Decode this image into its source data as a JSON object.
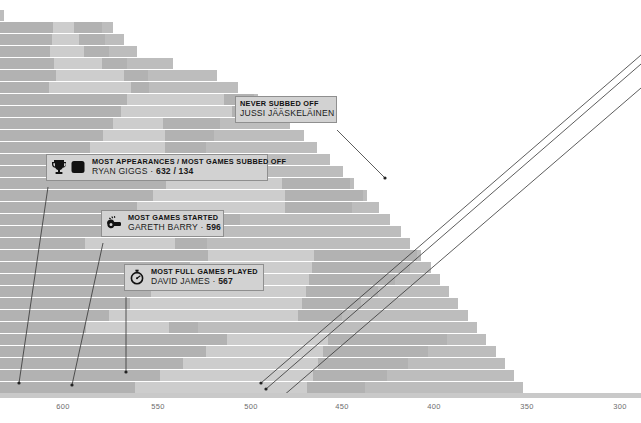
{
  "chart_data": {
    "type": "bar",
    "orientation": "horizontal",
    "title": "",
    "xlabel": "",
    "ylabel": "",
    "grid": false,
    "legend": "none",
    "xlim": [
      632,
      286
    ],
    "x_ticks": [
      600,
      550,
      500,
      450,
      400,
      350,
      300
    ],
    "x_tick_labels": [
      "600",
      "550",
      "500",
      "450",
      "400",
      "350",
      "300"
    ],
    "axis_direction": "descending",
    "note": "Stacked horizontal bars, one row per player, sorted descending by total appearances. Each bar is split into appearance-type segments (games started / full games played / subbed off).",
    "categories": [
      "Ryan Giggs",
      "David James",
      "Gareth Barry",
      "Frank Lampard",
      "Jussi Jaaskelainen",
      "Player 6",
      "Player 7",
      "Player 8",
      "Player 9",
      "Player 10",
      "Player 11",
      "Player 12",
      "Player 13",
      "Player 14",
      "Player 15",
      "Player 16",
      "Player 17",
      "Player 18",
      "Player 19",
      "Player 20",
      "Player 21",
      "Player 22",
      "Player 23",
      "Player 24",
      "Player 25",
      "Player 26",
      "Player 27",
      "Player 28",
      "Player 29",
      "Player 30",
      "Player 31",
      "Player 32"
    ],
    "values": [
      632,
      573,
      567,
      560,
      541,
      517,
      506,
      495,
      486,
      478,
      470,
      463,
      456,
      449,
      443,
      436,
      430,
      424,
      418,
      413,
      407,
      402,
      397,
      392,
      387,
      382,
      377,
      372,
      367,
      362,
      357,
      352
    ],
    "series": [
      {
        "name": "Segment A",
        "color": "#b2b2b2"
      },
      {
        "name": "Segment B",
        "color": "#cdcdcd"
      },
      {
        "name": "Segment C",
        "color": "#bdbdbd"
      }
    ],
    "annotations": [
      {
        "label": "MOST APPEARANCES / MOST GAMES SUBBED OFF",
        "player": "RYAN GIGGS",
        "value": "632 / 134"
      },
      {
        "label": "MOST GAMES STARTED",
        "player": "GARETH BARRY",
        "value": "596"
      },
      {
        "label": "MOST FULL GAMES PLAYED",
        "player": "DAVID JAMES",
        "value": "567"
      },
      {
        "label": "NEVER SUBBED OFF",
        "player": "JUSSI JÄÄSKELÄINEN",
        "value": ""
      }
    ]
  },
  "axis": {
    "ticks": [
      {
        "label": "600",
        "x": 63
      },
      {
        "label": "550",
        "x": 158
      },
      {
        "label": "500",
        "x": 251
      },
      {
        "label": "450",
        "x": 342
      },
      {
        "label": "400",
        "x": 434
      },
      {
        "label": "350",
        "x": 527
      },
      {
        "label": "300",
        "x": 620
      }
    ]
  },
  "callouts": {
    "never_subbed": {
      "title": "NEVER SUBBED OFF",
      "name": "JUSSI JÄÄSKELÄINEN",
      "value": "",
      "separator": ""
    },
    "most_appearances": {
      "title": "MOST APPEARANCES / MOST GAMES SUBBED OFF",
      "name": "RYAN GIGGS",
      "separator": " · ",
      "value": "632 / 134",
      "icons": [
        "trophy-icon",
        "substitution-icon"
      ]
    },
    "most_started": {
      "title": "MOST GAMES STARTED",
      "name": "GARETH BARRY",
      "separator": " · ",
      "value": "596",
      "icons": [
        "whistle-icon"
      ]
    },
    "most_full_games": {
      "title": "MOST FULL GAMES PLAYED",
      "name": "DAVID JAMES",
      "separator": " · ",
      "value": "567",
      "icons": [
        "stopwatch-icon"
      ]
    }
  },
  "colors": {
    "segment_dark": "#b2b2b2",
    "segment_light": "#cdcdcd",
    "segment_mid": "#bdbdbd",
    "callout_bg": "#d2d2d2",
    "callout_border": "#8f8f8f",
    "axis_rule": "#c9c9c9",
    "tick_text": "#6d6d6d",
    "leader_line": "#333333"
  }
}
